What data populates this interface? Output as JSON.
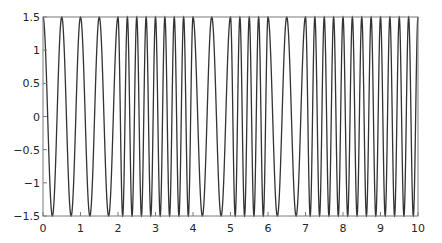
{
  "chart_data": {
    "type": "line",
    "title": "",
    "xlabel": "",
    "ylabel": "",
    "xlim": [
      0,
      10
    ],
    "ylim": [
      -1.5,
      1.5
    ],
    "grid": false,
    "legend": null,
    "x_ticks": [
      0,
      1,
      2,
      3,
      4,
      5,
      6,
      7,
      8,
      9,
      10
    ],
    "x_tick_labels": [
      "0",
      "1",
      "2",
      "3",
      "4",
      "5",
      "6",
      "7",
      "8",
      "9",
      "10"
    ],
    "y_ticks": [
      1.5,
      1,
      0.5,
      0,
      -0.5,
      -1,
      -1.5
    ],
    "y_tick_labels": [
      "1.5",
      "1",
      "0.5",
      "0",
      "−0.5",
      "−1",
      "−1.5"
    ],
    "series": [
      {
        "name": "signal",
        "color": "#333333",
        "formula": "y = 1.5 * cos(2*pi*f*t)",
        "amplitude": 1.5,
        "segments": [
          {
            "t_start": 0,
            "t_end": 2,
            "frequency": 2,
            "period": 0.5
          },
          {
            "t_start": 2,
            "t_end": 4,
            "frequency": 4,
            "period": 0.25
          },
          {
            "t_start": 4,
            "t_end": 5,
            "frequency": 2,
            "period": 0.5
          },
          {
            "t_start": 5,
            "t_end": 6,
            "frequency": 4,
            "period": 0.25
          },
          {
            "t_start": 6,
            "t_end": 7,
            "frequency": 2,
            "period": 0.5
          },
          {
            "t_start": 7,
            "t_end": 10,
            "frequency": 4,
            "period": 0.25
          }
        ]
      }
    ]
  },
  "colors": {
    "axis": "#7a7a7a",
    "line": "#333333",
    "background": "#ffffff"
  }
}
